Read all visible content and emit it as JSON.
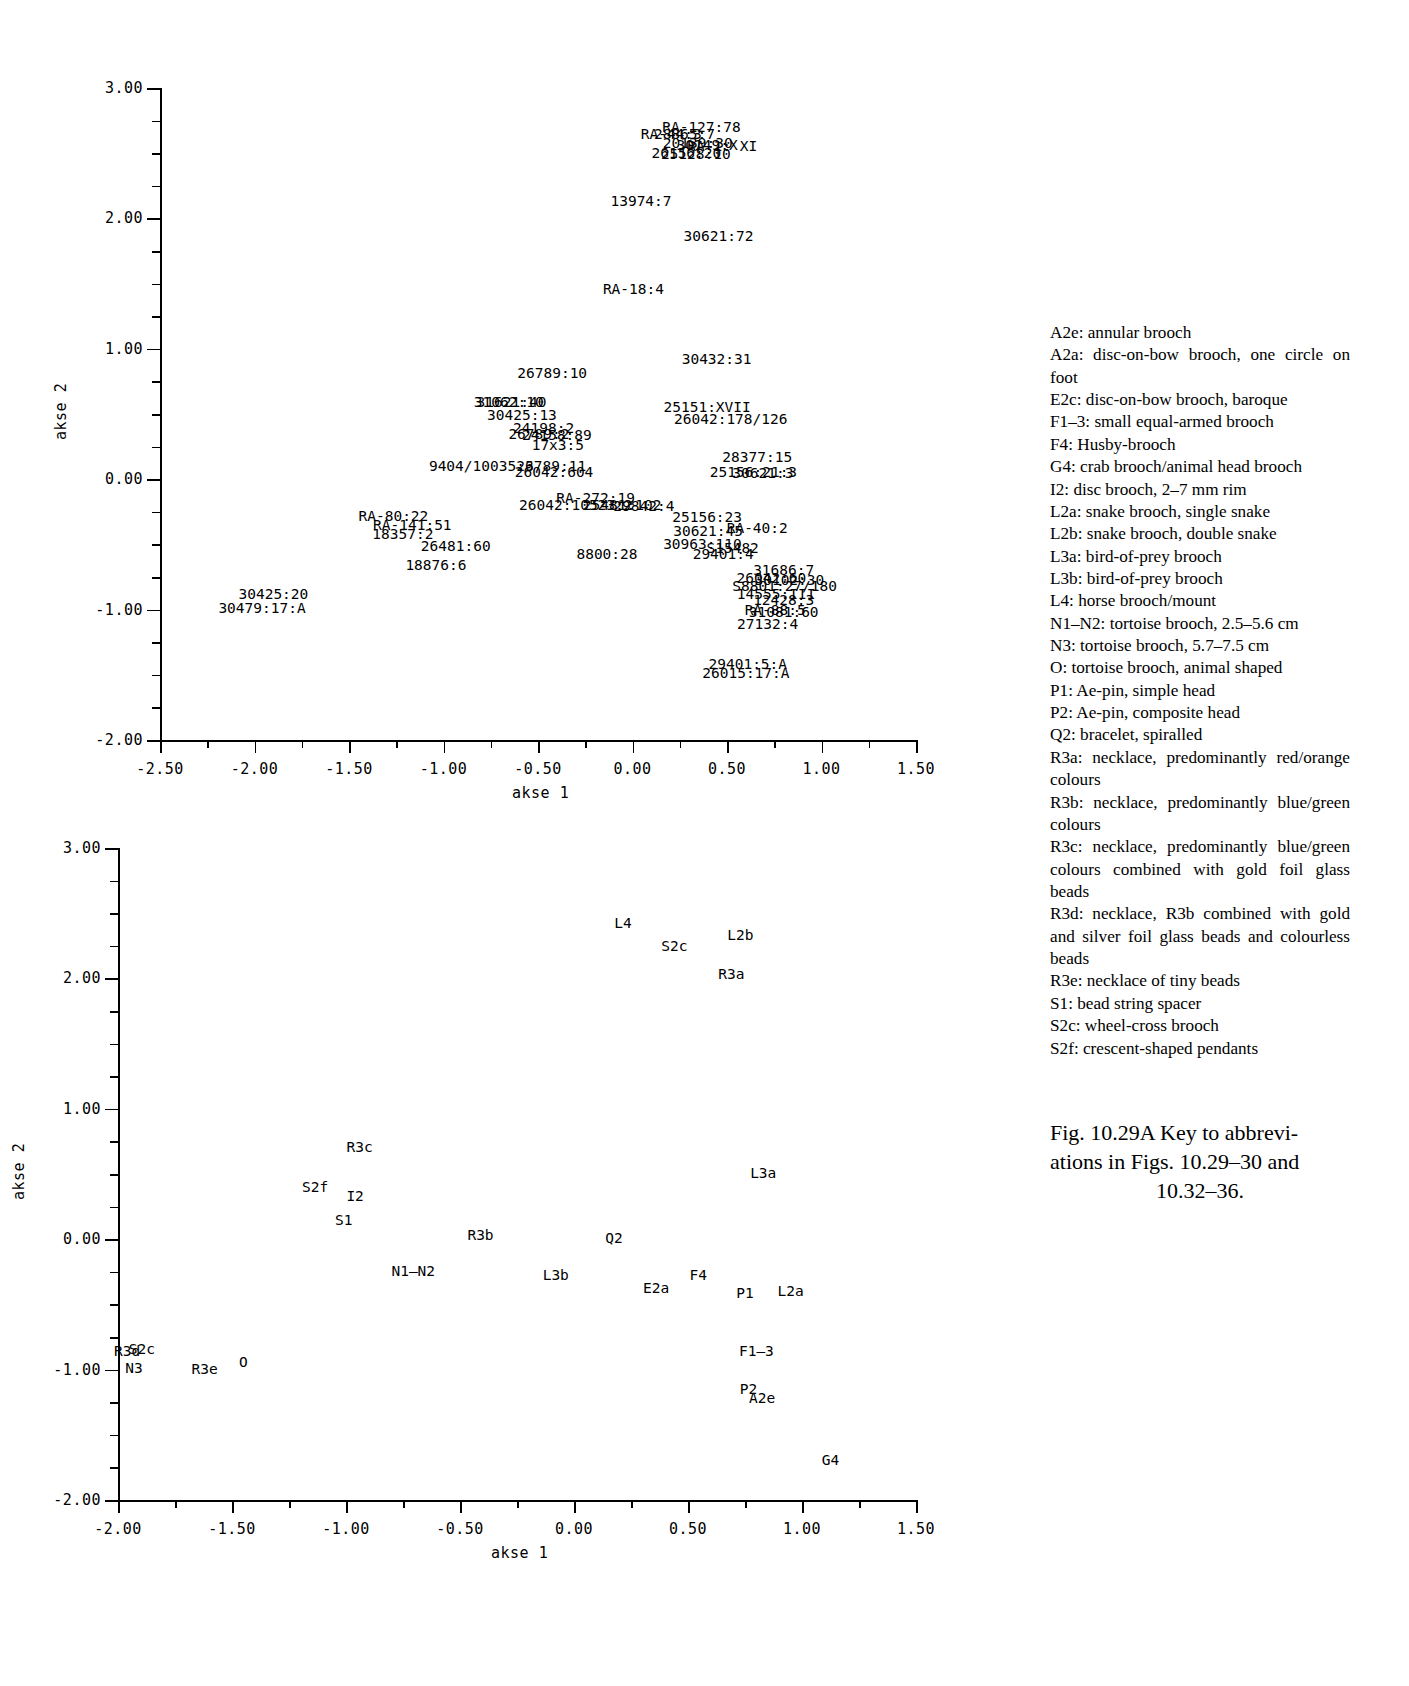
{
  "figure": {
    "caption_line1": "Fig. 10.29A  Key to abbrevi-",
    "caption_line2": "ations in Figs. 10.29–30 and",
    "caption_line3": "10.32–36."
  },
  "key": {
    "entries": [
      "A2e: annular brooch",
      "A2a: disc-on-bow brooch, one circle on foot",
      "E2c: disc-on-bow brooch, baroque",
      "F1–3: small equal-armed brooch",
      "F4: Husby-brooch",
      "G4: crab brooch/animal head brooch",
      "I2: disc brooch, 2–7 mm rim",
      "L2a: snake brooch, single snake",
      "L2b: snake brooch, double snake",
      "L3a: bird-of-prey brooch",
      "L3b: bird-of-prey brooch",
      "L4: horse brooch/mount",
      "N1–N2: tortoise brooch, 2.5–5.6 cm",
      "N3: tortoise brooch, 5.7–7.5 cm",
      "O: tortoise brooch, animal shaped",
      "P1: Ae-pin, simple head",
      "P2: Ae-pin, composite head",
      "Q2: bracelet, spiralled",
      "R3a: necklace, predominantly red/orange colours",
      "R3b: necklace, predominantly blue/green colours",
      "R3c: necklace, predominantly blue/green colours combined with gold foil glass beads",
      "R3d: necklace, R3b combined with gold and silver foil glass beads and colourless beads",
      "R3e: necklace of tiny beads",
      "S1: bead string spacer",
      "S2c: wheel-cross brooch",
      "S2f: crescent-shaped pendants"
    ]
  },
  "chart_data": [
    {
      "id": "graves-plot",
      "type": "scatter",
      "title": "",
      "xlabel": "akse 1",
      "ylabel": "akse 2",
      "xlim": [
        -2.5,
        1.5
      ],
      "ylim": [
        -2.0,
        3.0
      ],
      "xticks": [
        -2.5,
        -2.0,
        -1.5,
        -1.0,
        -0.5,
        0.0,
        0.5,
        1.0,
        1.5
      ],
      "xticklabels": [
        "-2.50",
        "-2.00",
        "-1.50",
        "-1.00",
        "-0.50",
        "0.00",
        "0.50",
        "1.00",
        "1.50"
      ],
      "yticks": [
        -2.0,
        -1.0,
        0.0,
        1.0,
        2.0,
        3.0
      ],
      "yticklabels": [
        "-2.00",
        "-1.00",
        "0.00",
        "1.00",
        "2.00",
        "3.00"
      ],
      "minor_tick_step": 0.25,
      "grid": false,
      "legend": "none",
      "points": [
        {
          "label": "RA-127:78",
          "x": 0.365,
          "y": 2.7
        },
        {
          "label": "RA-44:3",
          "x": 0.205,
          "y": 2.645
        },
        {
          "label": "28865:7",
          "x": 0.275,
          "y": 2.645
        },
        {
          "label": "20139:30",
          "x": 0.345,
          "y": 2.575
        },
        {
          "label": "30149:X",
          "x": 0.395,
          "y": 2.565
        },
        {
          "label": "RA-1: XI",
          "x": 0.475,
          "y": 2.555
        },
        {
          "label": "26156:20",
          "x": 0.285,
          "y": 2.505
        },
        {
          "label": "25128:10",
          "x": 0.335,
          "y": 2.495
        },
        {
          "label": "13974:7",
          "x": 0.045,
          "y": 2.135
        },
        {
          "label": "30621:72",
          "x": 0.455,
          "y": 1.865
        },
        {
          "label": "RA-18:4",
          "x": 0.005,
          "y": 1.455
        },
        {
          "label": "30432:31",
          "x": 0.445,
          "y": 0.925
        },
        {
          "label": "26789:10",
          "x": -0.425,
          "y": 0.815
        },
        {
          "label": "31621:40",
          "x": -0.64,
          "y": 0.595
        },
        {
          "label": "31062:10",
          "x": -0.655,
          "y": 0.59
        },
        {
          "label": "25151:XVII",
          "x": 0.395,
          "y": 0.55
        },
        {
          "label": "30425:13",
          "x": -0.585,
          "y": 0.49
        },
        {
          "label": "26042:178/126",
          "x": 0.52,
          "y": 0.46
        },
        {
          "label": "24198:2",
          "x": -0.47,
          "y": 0.395
        },
        {
          "label": "26789:2",
          "x": -0.495,
          "y": 0.345
        },
        {
          "label": "24158:89",
          "x": -0.4,
          "y": 0.34
        },
        {
          "label": "17x3:5",
          "x": -0.395,
          "y": 0.265
        },
        {
          "label": "28377:15",
          "x": 0.66,
          "y": 0.17
        },
        {
          "label": "9404/10035:3",
          "x": -0.8,
          "y": 0.105
        },
        {
          "label": "26789:11",
          "x": -0.43,
          "y": 0.1
        },
        {
          "label": "26042:604",
          "x": -0.415,
          "y": 0.055
        },
        {
          "label": "25156:21:3",
          "x": 0.64,
          "y": 0.055
        },
        {
          "label": "30621:3",
          "x": 0.69,
          "y": 0.05
        },
        {
          "label": "RA-272:19",
          "x": -0.195,
          "y": -0.145
        },
        {
          "label": "26042:10523:2",
          "x": -0.3,
          "y": -0.195
        },
        {
          "label": "25481:102",
          "x": -0.055,
          "y": -0.2
        },
        {
          "label": "29842:4",
          "x": 0.06,
          "y": -0.205
        },
        {
          "label": "25156:23",
          "x": 0.395,
          "y": -0.29
        },
        {
          "label": "RA-80:22",
          "x": -1.265,
          "y": -0.285
        },
        {
          "label": "RA-141:51",
          "x": -1.165,
          "y": -0.355
        },
        {
          "label": "30621:45",
          "x": 0.4,
          "y": -0.395
        },
        {
          "label": "RA-40:2",
          "x": 0.66,
          "y": -0.375
        },
        {
          "label": "18357:2",
          "x": -1.215,
          "y": -0.42
        },
        {
          "label": "26481:60",
          "x": -0.935,
          "y": -0.515
        },
        {
          "label": "30963:110",
          "x": 0.37,
          "y": -0.5
        },
        {
          "label": "S15482",
          "x": 0.53,
          "y": -0.53
        },
        {
          "label": "8800:28",
          "x": -0.135,
          "y": -0.57
        },
        {
          "label": "29401:4",
          "x": 0.48,
          "y": -0.575
        },
        {
          "label": "18876:6",
          "x": -1.04,
          "y": -0.66
        },
        {
          "label": "31686:7",
          "x": 0.8,
          "y": -0.695
        },
        {
          "label": "26042:60",
          "x": 0.735,
          "y": -0.755
        },
        {
          "label": "30102:30",
          "x": 0.83,
          "y": -0.775
        },
        {
          "label": "S8801:27/180",
          "x": 0.805,
          "y": -0.82
        },
        {
          "label": "14555:III",
          "x": 0.76,
          "y": -0.88
        },
        {
          "label": "30425:20",
          "x": -1.9,
          "y": -0.88
        },
        {
          "label": "12428:3",
          "x": 0.8,
          "y": -0.93
        },
        {
          "label": "30479:17:A",
          "x": -1.96,
          "y": -0.99
        },
        {
          "label": "RA-88:5",
          "x": 0.755,
          "y": -1.0
        },
        {
          "label": "31081:60",
          "x": 0.8,
          "y": -1.02
        },
        {
          "label": "27132:4",
          "x": 0.715,
          "y": -1.11
        },
        {
          "label": "29401:5:A",
          "x": 0.61,
          "y": -1.415
        },
        {
          "label": "26015:17:A",
          "x": 0.6,
          "y": -1.49
        }
      ]
    },
    {
      "id": "types-plot",
      "type": "scatter",
      "title": "",
      "xlabel": "akse 1",
      "ylabel": "akse 2",
      "xlim": [
        -2.0,
        1.5
      ],
      "ylim": [
        -2.0,
        3.0
      ],
      "xticks": [
        -2.0,
        -1.5,
        -1.0,
        -0.5,
        0.0,
        0.5,
        1.0,
        1.5
      ],
      "xticklabels": [
        "-2.00",
        "-1.50",
        "-1.00",
        "-0.50",
        "0.00",
        "0.50",
        "1.00",
        "1.50"
      ],
      "yticks": [
        -2.0,
        -1.0,
        0.0,
        1.0,
        2.0,
        3.0
      ],
      "yticklabels": [
        "-2.00",
        "-1.00",
        "0.00",
        "1.00",
        "2.00",
        "3.00"
      ],
      "minor_tick_step": 0.25,
      "grid": false,
      "legend": "none",
      "points": [
        {
          "label": "L4",
          "x": 0.215,
          "y": 2.425
        },
        {
          "label": "L2b",
          "x": 0.73,
          "y": 2.33
        },
        {
          "label": "S2c",
          "x": 0.44,
          "y": 2.245
        },
        {
          "label": "R3a",
          "x": 0.69,
          "y": 2.03
        },
        {
          "label": "R3c",
          "x": -0.94,
          "y": 0.705
        },
        {
          "label": "L3a",
          "x": 0.83,
          "y": 0.505
        },
        {
          "label": "S2f",
          "x": -1.135,
          "y": 0.4
        },
        {
          "label": "I2",
          "x": -0.96,
          "y": 0.335
        },
        {
          "label": "S1",
          "x": -1.01,
          "y": 0.145
        },
        {
          "label": "R3b",
          "x": -0.41,
          "y": 0.035
        },
        {
          "label": "Q2",
          "x": 0.175,
          "y": 0.01
        },
        {
          "label": "N1–N2",
          "x": -0.705,
          "y": -0.245
        },
        {
          "label": "L3b",
          "x": -0.08,
          "y": -0.275
        },
        {
          "label": "F4",
          "x": 0.545,
          "y": -0.275
        },
        {
          "label": "E2a",
          "x": 0.36,
          "y": -0.375
        },
        {
          "label": "P1",
          "x": 0.75,
          "y": -0.41
        },
        {
          "label": "L2a",
          "x": 0.95,
          "y": -0.395
        },
        {
          "label": "R3d",
          "x": -1.96,
          "y": -0.855
        },
        {
          "label": "S2c",
          "x": -1.895,
          "y": -0.845
        },
        {
          "label": "F1–3",
          "x": 0.8,
          "y": -0.855
        },
        {
          "label": "N3",
          "x": -1.93,
          "y": -0.985
        },
        {
          "label": "R3e",
          "x": -1.62,
          "y": -0.995
        },
        {
          "label": "O",
          "x": -1.45,
          "y": -0.94
        },
        {
          "label": "P2",
          "x": 0.765,
          "y": -1.145
        },
        {
          "label": "A2e",
          "x": 0.825,
          "y": -1.215
        },
        {
          "label": "G4",
          "x": 1.125,
          "y": -1.69
        }
      ]
    }
  ]
}
